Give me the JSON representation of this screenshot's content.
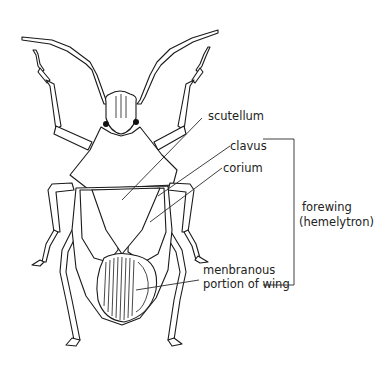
{
  "diagram": {
    "labels": {
      "scutellum": "scutellum",
      "clavus": "clavus",
      "corium": "corium",
      "membranous_line1": "menbranous",
      "membranous_line2": "portion of wing",
      "forewing_line1": "forewing",
      "forewing_line2": "(hemelytron)"
    },
    "colors": {
      "line": "#1a1a1a",
      "text": "#222222",
      "background": "#ffffff"
    }
  }
}
